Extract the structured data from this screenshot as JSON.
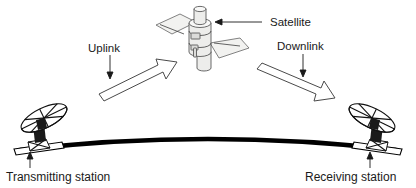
{
  "diagram": {
    "background_color": "#ffffff",
    "ink_color": "#1a1a1a",
    "labels": {
      "satellite": "Satellite",
      "uplink": "Uplink",
      "downlink": "Downlink",
      "transmitting_station": "Transmitting station",
      "receiving_station": "Receiving station"
    },
    "elements": {
      "satellite_icon": "satellite-icon",
      "uplink_arrow_icon": "uplink-arrow-icon",
      "downlink_arrow_icon": "downlink-arrow-icon",
      "satellite_pointer_icon": "left-pointer-arrow-icon",
      "uplink_pointer_icon": "down-pointer-arrow-icon",
      "downlink_pointer_icon": "down-pointer-arrow-icon",
      "transmitting_pointer_icon": "up-pointer-arrow-icon",
      "receiving_pointer_icon": "up-pointer-arrow-icon",
      "transmitting_dish_icon": "parabolic-dish-antenna-icon",
      "receiving_dish_icon": "parabolic-dish-antenna-icon",
      "earth_surface_icon": "earth-curvature-arc"
    },
    "colors": {
      "earth_arc": "#000000",
      "arrow_outline": "#4a4a4a",
      "arrow_fill": "#ffffff",
      "satellite_body": "#ededeb",
      "solar_panel": "#f2f2f0"
    }
  }
}
